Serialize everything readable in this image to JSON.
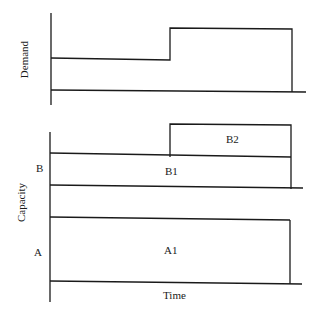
{
  "top_panel": {
    "ylabel": "Demand",
    "steps": [
      {
        "start": 0,
        "end": 0.49,
        "level": "low"
      },
      {
        "start": 0.49,
        "end": 1.0,
        "level": "high"
      }
    ]
  },
  "bottom_panel": {
    "ylabel": "Capacity",
    "xlabel": "Time",
    "groups": [
      {
        "label": "B",
        "blocks": [
          {
            "label": "B1",
            "start": 0,
            "end": 1.0
          },
          {
            "label": "B2",
            "start": 0.49,
            "end": 1.0
          }
        ]
      },
      {
        "label": "A",
        "blocks": [
          {
            "label": "A1",
            "start": 0,
            "end": 1.0
          }
        ]
      }
    ]
  }
}
